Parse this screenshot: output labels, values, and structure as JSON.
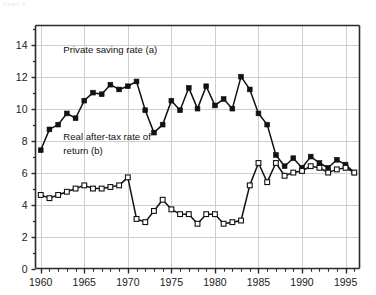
{
  "figure": {
    "corner_note": "Chart 3",
    "background": "#ffffff",
    "axis_color": "#2b2b2b",
    "grid_color": "#cfcfcf"
  },
  "chart_data": {
    "type": "line",
    "title": "",
    "xlabel": "",
    "ylabel": "",
    "xlim": [
      1959.4,
      1996.6
    ],
    "ylim": [
      0,
      15.2
    ],
    "grid": true,
    "legend_position": "inline-annotation",
    "yticks": [
      0,
      2,
      4,
      6,
      8,
      10,
      12,
      14
    ],
    "ytick_labels": [
      "0",
      "2",
      "4",
      "6",
      "8",
      "10",
      "12",
      "14"
    ],
    "xticks": [
      1960,
      1965,
      1970,
      1975,
      1980,
      1985,
      1990,
      1995
    ],
    "xtick_labels": [
      "1960",
      "1965",
      "1970",
      "1975",
      "1980",
      "1985",
      "1990",
      "1995"
    ],
    "xminor_step": 1,
    "annotations": [
      {
        "id": "private-saving-label",
        "text": "Private saving rate (a)",
        "x": 1962.6,
        "y": 13.45
      },
      {
        "id": "real-return-label-line1",
        "text": "Real after-tax rate of",
        "x": 1962.6,
        "y": 8.05
      },
      {
        "id": "real-return-label-line2",
        "text": "return (b)",
        "x": 1962.6,
        "y": 7.15
      }
    ],
    "x": [
      1960,
      1961,
      1962,
      1963,
      1964,
      1965,
      1966,
      1967,
      1968,
      1969,
      1970,
      1971,
      1972,
      1973,
      1974,
      1975,
      1976,
      1977,
      1978,
      1979,
      1980,
      1981,
      1982,
      1983,
      1984,
      1985,
      1986,
      1987,
      1988,
      1989,
      1990,
      1991,
      1992,
      1993,
      1994,
      1995,
      1996
    ],
    "series": [
      {
        "name": "Private saving rate (a)",
        "label": "Private saving rate (a)",
        "marker": "filled-square",
        "color": "#111111",
        "values": [
          7.4,
          8.7,
          9.0,
          9.7,
          9.4,
          10.5,
          11.0,
          10.9,
          11.5,
          11.2,
          11.4,
          11.7,
          9.9,
          8.5,
          9.0,
          10.5,
          9.9,
          11.3,
          10.0,
          11.4,
          10.2,
          10.6,
          10.0,
          12.0,
          11.2,
          9.7,
          9.0,
          7.1,
          6.4,
          6.9,
          6.3,
          7.0,
          6.6,
          6.3,
          6.8,
          6.5,
          6.0
        ]
      },
      {
        "name": "Real after-tax rate of return (b)",
        "label": "Real after-tax rate of return (b)",
        "marker": "open-square",
        "color": "#111111",
        "values": [
          4.6,
          4.4,
          4.6,
          4.8,
          5.0,
          5.2,
          5.0,
          5.0,
          5.1,
          5.2,
          5.7,
          3.1,
          2.9,
          3.6,
          4.3,
          3.7,
          3.4,
          3.4,
          2.8,
          3.4,
          3.4,
          2.8,
          2.9,
          3.0,
          5.2,
          6.6,
          5.4,
          6.6,
          5.8,
          6.0,
          6.1,
          6.4,
          6.3,
          6.0,
          6.2,
          6.3,
          6.0
        ]
      }
    ]
  }
}
